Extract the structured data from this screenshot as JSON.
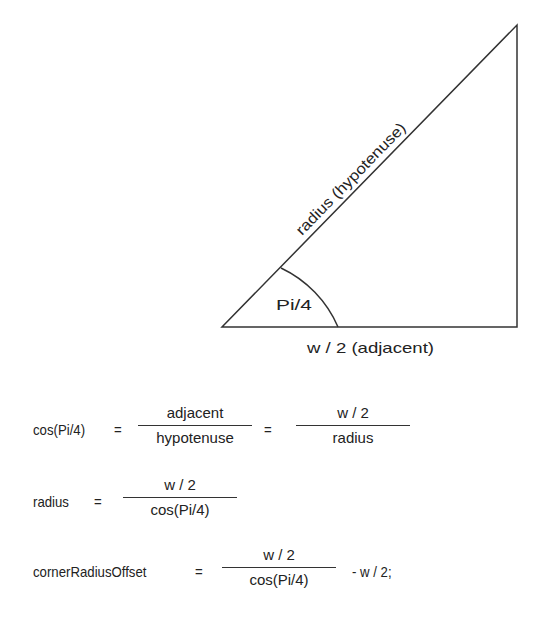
{
  "diagram": {
    "hypotenuse_label": "radius (hypotenuse)",
    "adjacent_label": "w / 2 (adjacent)",
    "angle_label": "Pi/4"
  },
  "equations": {
    "eq1": {
      "lhs": "cos(Pi/4)",
      "op1": "=",
      "frac1_num": "adjacent",
      "frac1_den": "hypotenuse",
      "op2": "=",
      "frac2_num": "w / 2",
      "frac2_den": "radius"
    },
    "eq2": {
      "lhs": "radius",
      "op": "=",
      "frac_num": "w / 2",
      "frac_den": "cos(Pi/4)"
    },
    "eq3": {
      "lhs": "cornerRadiusOffset",
      "op": "=",
      "frac_num": "w / 2",
      "frac_den": "cos(Pi/4)",
      "tail": "-  w / 2;"
    }
  }
}
